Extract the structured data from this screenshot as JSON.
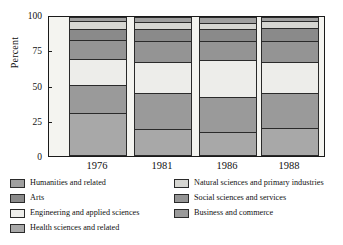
{
  "chart_data": {
    "type": "bar",
    "subtype": "stacked-percent-column",
    "title": "",
    "xlabel": "",
    "ylabel": "Percent",
    "categories": [
      "1976",
      "1981",
      "1986",
      "1988"
    ],
    "ylim": [
      0,
      100
    ],
    "yticks": [
      0,
      25,
      50,
      75,
      100
    ],
    "ytick_labels": [
      "0",
      "25",
      "50",
      "75",
      "100"
    ],
    "grid": false,
    "legend_position": "bottom",
    "stack_order_bottom_to_top": [
      "Health sciences and related",
      "Business and commerce",
      "Engineering and applied sciences",
      "Social sciences and services",
      "Arts",
      "Natural sciences and primary industries",
      "Humanities and related"
    ],
    "series": [
      {
        "name": "Health sciences and related",
        "color": "#a8a8a8",
        "values": [
          31,
          19,
          17,
          20
        ]
      },
      {
        "name": "Business and commerce",
        "color": "#9a9a9a",
        "values": [
          21,
          27,
          26,
          26
        ]
      },
      {
        "name": "Engineering and applied sciences",
        "color": "#ededea",
        "values": [
          19,
          23,
          27,
          23
        ]
      },
      {
        "name": "Social sciences and services",
        "color": "#949494",
        "values": [
          14,
          15,
          14,
          15
        ]
      },
      {
        "name": "Arts",
        "color": "#8a8a8a",
        "values": [
          7,
          8,
          8,
          9
        ]
      },
      {
        "name": "Natural sciences and primary industries",
        "color": "#d6d6d2",
        "values": [
          6,
          5,
          4,
          5
        ]
      },
      {
        "name": "Humanities and related",
        "color": "#9f9f9f",
        "values": [
          2,
          3,
          4,
          2
        ]
      }
    ]
  },
  "axis": {
    "y_title": "Percent",
    "y_ticks": [
      "100",
      "75",
      "50",
      "25",
      "0"
    ],
    "x_labels": [
      "1976",
      "1981",
      "1986",
      "1988"
    ]
  },
  "legend": {
    "left_column": [
      {
        "label": "Humanities and related",
        "color": "#9f9f9f"
      },
      {
        "label": "Arts",
        "color": "#8a8a8a"
      },
      {
        "label": "Engineering and applied sciences",
        "color": "#ededea"
      },
      {
        "label": "Health sciences and related",
        "color": "#a8a8a8"
      }
    ],
    "right_column": [
      {
        "label": "Natural sciences and primary industries",
        "color": "#d6d6d2"
      },
      {
        "label": "Social sciences and services",
        "color": "#949494"
      },
      {
        "label": "Business and commerce",
        "color": "#9a9a9a"
      }
    ]
  }
}
